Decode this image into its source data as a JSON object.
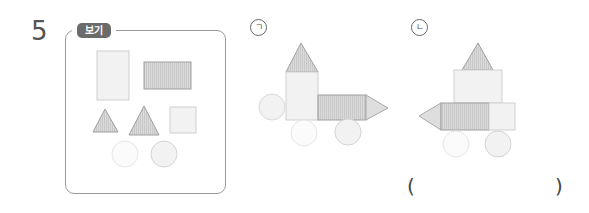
{
  "question": {
    "number": "5",
    "example_label": "보기"
  },
  "example_box": {
    "shapes": [
      {
        "kind": "rectangle",
        "orientation": "tall",
        "fill": "#f1f1f1"
      },
      {
        "kind": "rectangle",
        "orientation": "wide",
        "fill": "#d9d9d9",
        "pattern": "striped"
      },
      {
        "kind": "triangle",
        "size": "small",
        "fill": "#cfcfcf"
      },
      {
        "kind": "triangle",
        "size": "large",
        "fill": "#cfcfcf"
      },
      {
        "kind": "square",
        "fill": "#f1f1f1"
      },
      {
        "kind": "circle",
        "fill": "#fafafa"
      },
      {
        "kind": "circle",
        "fill": "#f2f2f2"
      }
    ]
  },
  "options": [
    {
      "label": "ㄱ",
      "description": "vehicle shape: triangle on tall rectangle, wide rectangle with arrow triangle pointing right, three circles"
    },
    {
      "label": "ㄴ",
      "description": "vehicle shape: triangle on square, wide rectangle with arrow triangle pointing left, small square, two circles"
    }
  ],
  "answer": {
    "open_paren": "(",
    "close_paren": ")",
    "value": ""
  },
  "colors": {
    "outline": "#9a9a9a",
    "badge": "#6b6b6b",
    "light_fill": "#f1f1f1",
    "dark_fill": "#d6d6d6",
    "shape_stroke": "#a8a8a8",
    "circle_stroke": "#dcdcdc"
  }
}
